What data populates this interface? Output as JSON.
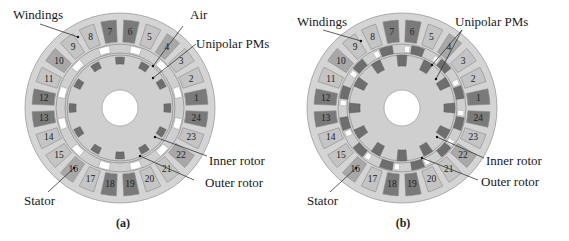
{
  "figure": {
    "panels": [
      {
        "id": "a",
        "caption": "(a)",
        "labels": {
          "windings": "Windings",
          "air": "Air",
          "unipolar_pms": "Unipolar PMs",
          "inner_rotor": "Inner rotor",
          "outer_rotor": "Outer rotor",
          "stator": "Stator"
        }
      },
      {
        "id": "b",
        "caption": "(b)",
        "labels": {
          "windings": "Windings",
          "unipolar_pms": "Unipolar PMs",
          "inner_rotor": "Inner rotor",
          "outer_rotor": "Outer rotor",
          "stator": "Stator"
        }
      }
    ],
    "slot_numbers": [
      "1",
      "2",
      "3",
      "4",
      "5",
      "6",
      "7",
      "8",
      "9",
      "10",
      "11",
      "12",
      "13",
      "14",
      "15",
      "16",
      "17",
      "18",
      "19",
      "20",
      "21",
      "22",
      "23",
      "24"
    ],
    "slot_shading": [
      "dark",
      "light",
      "light",
      "mid",
      "light",
      "dark",
      "dark",
      "light",
      "light",
      "mid",
      "light",
      "dark",
      "dark",
      "light",
      "light",
      "mid",
      "light",
      "dark",
      "dark",
      "light",
      "light",
      "mid",
      "light",
      "dark"
    ],
    "colors": {
      "stator": "#d4d4d4",
      "stator_edge": "#9a9a9a",
      "winding_dark": "#7a7a7a",
      "winding_mid": "#a8a8a8",
      "winding_light": "#c4c4c4",
      "rotor": "#cfcfcf",
      "pm": "#6e6e6e",
      "air": "#ffffff"
    }
  }
}
